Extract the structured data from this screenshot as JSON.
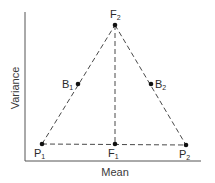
{
  "diagram": {
    "axes": {
      "x_label": "Mean",
      "y_label": "Variance"
    },
    "points": [
      {
        "id": "F2",
        "base": "F",
        "sub": "2",
        "x": 115,
        "y": 25
      },
      {
        "id": "B1",
        "base": "B",
        "sub": "1",
        "x": 78,
        "y": 84
      },
      {
        "id": "B2",
        "base": "B",
        "sub": "2",
        "x": 151,
        "y": 84
      },
      {
        "id": "P1",
        "base": "P",
        "sub": "1",
        "x": 42,
        "y": 144
      },
      {
        "id": "F1",
        "base": "F",
        "sub": "1",
        "x": 115,
        "y": 144
      },
      {
        "id": "P2",
        "base": "P",
        "sub": "2",
        "x": 186,
        "y": 145
      }
    ],
    "edges": [
      {
        "from": "P1",
        "to": "F2",
        "style": "dashed"
      },
      {
        "from": "F2",
        "to": "P2",
        "style": "dashed"
      },
      {
        "from": "P1",
        "to": "P2",
        "style": "dashed"
      },
      {
        "from": "F2",
        "to": "F1",
        "style": "dashed"
      }
    ],
    "colors": {
      "line": "#333333",
      "dot": "#111111",
      "background": "#ffffff"
    }
  }
}
